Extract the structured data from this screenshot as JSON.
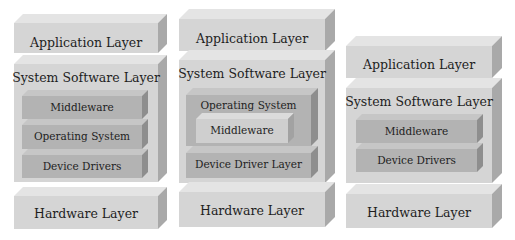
{
  "diagram": {
    "title": "",
    "colors": {
      "outer_front": "#d5d5d5",
      "outer_top": "#e4e4e4",
      "outer_side": "#a9a9a9",
      "inner_front": "#b3b3b3",
      "inner_top": "#c6c6c6",
      "inner_side": "#8e8e8e",
      "light_inner_front": "#cfcfcf",
      "light_inner_top": "#dcdcdc",
      "light_inner_side": "#a2a2a2",
      "text": "#1e1e1e"
    },
    "stacks": [
      {
        "name": "stack-1",
        "layers": [
          {
            "id": "application-layer",
            "label": "Application Layer",
            "kind": "outer",
            "x": 14,
            "y": 23,
            "w": 144,
            "h": 30,
            "d": 9,
            "fs": 12.5,
            "ty": 12
          },
          {
            "id": "system-software-layer",
            "label": "System Software Layer",
            "kind": "outer",
            "x": 14,
            "y": 64,
            "w": 144,
            "h": 118,
            "d": 9,
            "fs": 12.5,
            "ty": 6
          },
          {
            "id": "middleware",
            "label": "Middleware",
            "kind": "inner",
            "x": 22,
            "y": 96,
            "w": 120,
            "h": 23,
            "d": 6,
            "fs": 10.5,
            "ty": 5
          },
          {
            "id": "operating-system",
            "label": "Operating System",
            "kind": "inner",
            "x": 22,
            "y": 125,
            "w": 120,
            "h": 24,
            "d": 6,
            "fs": 10.5,
            "ty": 5
          },
          {
            "id": "device-drivers",
            "label": "Device Drivers",
            "kind": "inner",
            "x": 22,
            "y": 155,
            "w": 120,
            "h": 23,
            "d": 6,
            "fs": 10.5,
            "ty": 5
          },
          {
            "id": "hardware-layer",
            "label": "Hardware Layer",
            "kind": "outer",
            "x": 14,
            "y": 196,
            "w": 144,
            "h": 33,
            "d": 9,
            "fs": 12.5,
            "ty": 10
          }
        ]
      },
      {
        "name": "stack-2",
        "layers": [
          {
            "id": "application-layer",
            "label": "Application Layer",
            "kind": "outer",
            "x": 179,
            "y": 19,
            "w": 146,
            "h": 32,
            "d": 10,
            "fs": 12.5,
            "ty": 12
          },
          {
            "id": "system-software-layer",
            "label": "System Software Layer",
            "kind": "outer",
            "x": 179,
            "y": 60,
            "w": 146,
            "h": 123,
            "d": 10,
            "fs": 12.5,
            "ty": 6
          },
          {
            "id": "operating-system",
            "label": "Operating System",
            "kind": "inner",
            "x": 186,
            "y": 95,
            "w": 125,
            "h": 51,
            "d": 7,
            "fs": 10.5,
            "ty": 4
          },
          {
            "id": "middleware",
            "label": "Middleware",
            "kind": "light_inner",
            "x": 196,
            "y": 119,
            "w": 92,
            "h": 24,
            "d": 6,
            "fs": 10.5,
            "ty": 5
          },
          {
            "id": "device-driver-layer",
            "label": "Device Driver Layer",
            "kind": "inner",
            "x": 186,
            "y": 153,
            "w": 125,
            "h": 25,
            "d": 7,
            "fs": 10.5,
            "ty": 5
          },
          {
            "id": "hardware-layer",
            "label": "Hardware Layer",
            "kind": "outer",
            "x": 179,
            "y": 192,
            "w": 146,
            "h": 35,
            "d": 10,
            "fs": 12.5,
            "ty": 11
          }
        ]
      },
      {
        "name": "stack-3",
        "layers": [
          {
            "id": "application-layer",
            "label": "Application Layer",
            "kind": "outer",
            "x": 346,
            "y": 46,
            "w": 146,
            "h": 32,
            "d": 10,
            "fs": 12.5,
            "ty": 11
          },
          {
            "id": "system-software-layer",
            "label": "System Software Layer",
            "kind": "outer",
            "x": 346,
            "y": 88,
            "w": 146,
            "h": 95,
            "d": 10,
            "fs": 12.5,
            "ty": 6
          },
          {
            "id": "middleware",
            "label": "Middleware",
            "kind": "inner",
            "x": 356,
            "y": 120,
            "w": 121,
            "h": 23,
            "d": 6,
            "fs": 10.5,
            "ty": 5
          },
          {
            "id": "device-drivers",
            "label": "Device Drivers",
            "kind": "inner",
            "x": 356,
            "y": 149,
            "w": 121,
            "h": 23,
            "d": 6,
            "fs": 10.5,
            "ty": 5
          },
          {
            "id": "hardware-layer",
            "label": "Hardware Layer",
            "kind": "outer",
            "x": 346,
            "y": 194,
            "w": 146,
            "h": 34,
            "d": 10,
            "fs": 12.5,
            "ty": 11
          }
        ]
      }
    ]
  }
}
